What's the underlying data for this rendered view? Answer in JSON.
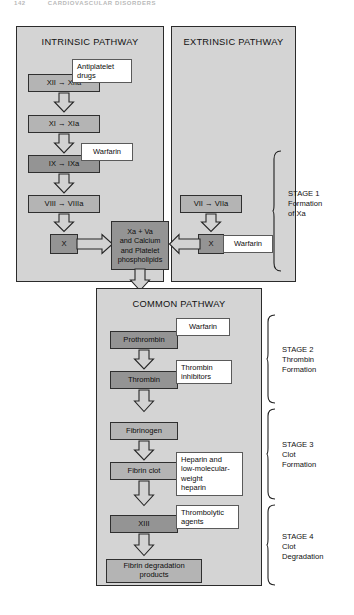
{
  "running_head": {
    "page": "142",
    "text": "CARDIOVASCULAR DISORDERS"
  },
  "panels": {
    "intrinsic": {
      "title": "INTRINSIC PATHWAY"
    },
    "extrinsic": {
      "title": "EXTRINSIC PATHWAY"
    },
    "common": {
      "title": "COMMON PATHWAY"
    }
  },
  "intrinsic_nodes": [
    {
      "id": "f12",
      "label": "XII → XIIa"
    },
    {
      "id": "f11",
      "label": "XI → XIa"
    },
    {
      "id": "f9",
      "label": "IX → IXa"
    },
    {
      "id": "f8",
      "label": "VIII → VIIIa"
    },
    {
      "id": "f10i",
      "label": "X"
    }
  ],
  "extrinsic_nodes": [
    {
      "id": "f7",
      "label": "VII → VIIa"
    },
    {
      "id": "f10e",
      "label": "X"
    }
  ],
  "center_node": {
    "id": "xa-complex",
    "lines": [
      "Xa + Va",
      "and Calcium",
      "and Platelet",
      "phospholipids"
    ]
  },
  "common_nodes": [
    {
      "id": "prothrombin",
      "label": "Prothrombin"
    },
    {
      "id": "thrombin",
      "label": "Thrombin"
    },
    {
      "id": "fibrinogen",
      "label": "Fibrinogen"
    },
    {
      "id": "fibrin-clot",
      "label": "Fibrin clot"
    },
    {
      "id": "f13",
      "label": "XIII"
    },
    {
      "id": "fdp",
      "lines": [
        "Fibrin degradation",
        "products"
      ]
    }
  ],
  "drugs": {
    "antiplatelet": {
      "lines": [
        "Antiplatelet",
        "drugs"
      ]
    },
    "warfarin_ix": {
      "label": "Warfarin"
    },
    "warfarin_x": {
      "label": "Warfarin"
    },
    "warfarin_proth": {
      "label": "Warfarin"
    },
    "thrombin_inhib": {
      "lines": [
        "Thrombin",
        "inhibitors"
      ]
    },
    "heparin": {
      "lines": [
        "Heparin and",
        "low-molecular-",
        "weight",
        "heparin"
      ]
    },
    "thrombolytic": {
      "lines": [
        "Thrombolytic",
        "agents"
      ]
    }
  },
  "stages": [
    {
      "id": "stage1",
      "title": "STAGE 1",
      "lines": [
        "Formation",
        "of Xa"
      ]
    },
    {
      "id": "stage2",
      "title": "STAGE 2",
      "lines": [
        "Thrombin",
        "Formation"
      ]
    },
    {
      "id": "stage3",
      "title": "STAGE 3",
      "lines": [
        "Clot",
        "Formation"
      ]
    },
    {
      "id": "stage4",
      "title": "STAGE 4",
      "lines": [
        "Clot",
        "Degradation"
      ]
    }
  ],
  "colors": {
    "panel_fill": "#d4d4d4",
    "node_fill": "#b4b4b4",
    "node_fill_dark": "#949494",
    "callout_fill": "#ffffff",
    "stroke": "#2b2b2b"
  }
}
